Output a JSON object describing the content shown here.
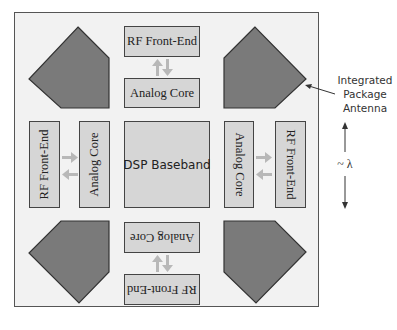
{
  "diagram": {
    "blocks": {
      "top_rf": "RF Front-End",
      "top_analog": "Analog Core",
      "left_rf": "RF Front-End",
      "left_analog": "Analog Core",
      "center_dsp": "DSP Baseband",
      "right_analog": "Analog Core",
      "right_rf": "RF Front-End",
      "bottom_analog": "Analog Core",
      "bottom_rf": "RF Front-End"
    },
    "annotations": {
      "antenna_label_line1": "Integrated",
      "antenna_label_line2": "Package",
      "antenna_label_line3": "Antenna",
      "wavelength_label": "~ λ"
    },
    "antennas": [
      "top-left",
      "top-right",
      "bottom-left",
      "bottom-right"
    ],
    "colors": {
      "frame_fill": "#f2f2f2",
      "block_fill": "#d6d6d6",
      "antenna_fill": "#7a7a7a",
      "arrow_fill": "#b8b8b8",
      "outline": "#444444"
    }
  }
}
